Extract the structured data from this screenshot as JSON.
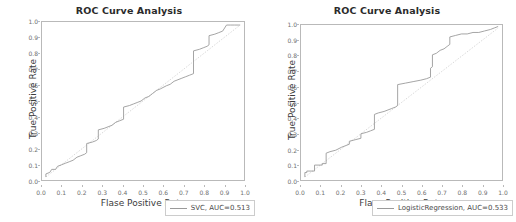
{
  "figure": {
    "width": 516,
    "height": 222,
    "background": "#ffffff",
    "panels": [
      {
        "id": "roc-left",
        "title": "ROC Curve Analysis",
        "xlabel": "Flase Positive Rate",
        "ylabel": "True Positive Rate",
        "legend_label": "SVC, AUC=0.513",
        "legend_line_color": "#9a9a9a"
      },
      {
        "id": "roc-right",
        "title": "ROC Curve Analysis",
        "xlabel": "Flase Positive Rate",
        "ylabel": "True Positive Rate",
        "legend_label": "LogisticRegression, AUC=0.533",
        "legend_line_color": "#9a9a9a"
      }
    ]
  },
  "ticks": {
    "x": [
      "0.0",
      "0.1",
      "0.2",
      "0.3",
      "0.4",
      "0.5",
      "0.6",
      "0.7",
      "0.8",
      "0.9",
      "1.0"
    ],
    "y": [
      "0.0",
      "0.1",
      "0.2",
      "0.3",
      "0.4",
      "0.5",
      "0.6",
      "0.7",
      "0.8",
      "0.9",
      "1.0"
    ]
  },
  "colors": {
    "curve": "#9a9a9a",
    "chance_line": "#cfcfcf",
    "axis": "#b9b9b9",
    "title_text": "#2b2b2b",
    "tick_text": "#6e6e6e",
    "label_text": "#3c3c3c"
  },
  "chart_data": [
    {
      "type": "line",
      "id": "roc-left",
      "title": "ROC Curve Analysis",
      "xlabel": "Flase Positive Rate",
      "ylabel": "True Positive Rate",
      "xlim": [
        -0.02,
        1.02
      ],
      "ylim": [
        -0.02,
        1.02
      ],
      "grid": false,
      "legend_position": "lower right",
      "annotations": [
        "dashed chance diagonal from (0,0) to (1,1)"
      ],
      "series": [
        {
          "name": "SVC, AUC=0.513",
          "auc": 0.513,
          "drawstyle": "steps-post",
          "color": "#9a9a9a",
          "x": [
            0.0,
            0.0,
            0.02,
            0.03,
            0.05,
            0.06,
            0.08,
            0.1,
            0.12,
            0.14,
            0.16,
            0.18,
            0.2,
            0.21,
            0.21,
            0.24,
            0.26,
            0.27,
            0.27,
            0.3,
            0.32,
            0.34,
            0.36,
            0.38,
            0.4,
            0.4,
            0.43,
            0.45,
            0.47,
            0.49,
            0.51,
            0.53,
            0.55,
            0.57,
            0.59,
            0.62,
            0.64,
            0.66,
            0.68,
            0.7,
            0.72,
            0.74,
            0.76,
            0.76,
            0.79,
            0.81,
            0.83,
            0.84,
            0.84,
            0.87,
            0.89,
            0.91,
            0.93,
            0.95,
            0.97,
            0.99,
            1.0
          ],
          "y": [
            0.0,
            0.02,
            0.03,
            0.05,
            0.05,
            0.07,
            0.08,
            0.09,
            0.1,
            0.11,
            0.13,
            0.14,
            0.15,
            0.16,
            0.22,
            0.23,
            0.24,
            0.25,
            0.31,
            0.32,
            0.33,
            0.34,
            0.36,
            0.37,
            0.38,
            0.46,
            0.47,
            0.48,
            0.49,
            0.5,
            0.52,
            0.53,
            0.55,
            0.57,
            0.58,
            0.6,
            0.61,
            0.63,
            0.64,
            0.65,
            0.66,
            0.67,
            0.68,
            0.83,
            0.84,
            0.85,
            0.86,
            0.87,
            0.93,
            0.94,
            0.95,
            0.96,
            1.0,
            1.0,
            1.0,
            1.0,
            1.0
          ]
        },
        {
          "name": "chance",
          "style": "dotted",
          "color": "#cfcfcf",
          "x": [
            0.0,
            1.0
          ],
          "y": [
            0.0,
            1.0
          ]
        }
      ]
    },
    {
      "type": "line",
      "id": "roc-right",
      "title": "ROC Curve Analysis",
      "xlabel": "Flase Positive Rate",
      "ylabel": "True Positive Rate",
      "xlim": [
        -0.02,
        1.02
      ],
      "ylim": [
        -0.02,
        1.02
      ],
      "grid": false,
      "legend_position": "lower right",
      "annotations": [
        "dashed chance diagonal from (0,0) to (1,1)"
      ],
      "series": [
        {
          "name": "LogisticRegression, AUC=0.533",
          "auc": 0.533,
          "drawstyle": "steps-post",
          "color": "#9a9a9a",
          "x": [
            0.0,
            0.0,
            0.01,
            0.01,
            0.05,
            0.05,
            0.09,
            0.09,
            0.11,
            0.11,
            0.13,
            0.16,
            0.19,
            0.21,
            0.23,
            0.23,
            0.26,
            0.29,
            0.29,
            0.32,
            0.34,
            0.36,
            0.36,
            0.38,
            0.41,
            0.43,
            0.45,
            0.47,
            0.48,
            0.48,
            0.52,
            0.56,
            0.6,
            0.63,
            0.65,
            0.65,
            0.66,
            0.66,
            0.68,
            0.7,
            0.72,
            0.74,
            0.75,
            0.75,
            0.78,
            0.81,
            0.84,
            0.87,
            0.9,
            0.93,
            0.96,
            0.98,
            1.0
          ],
          "y": [
            0.0,
            0.03,
            0.03,
            0.04,
            0.04,
            0.08,
            0.08,
            0.09,
            0.09,
            0.16,
            0.17,
            0.18,
            0.2,
            0.21,
            0.22,
            0.24,
            0.25,
            0.26,
            0.29,
            0.3,
            0.31,
            0.32,
            0.42,
            0.43,
            0.44,
            0.45,
            0.46,
            0.47,
            0.48,
            0.62,
            0.63,
            0.64,
            0.65,
            0.66,
            0.67,
            0.73,
            0.74,
            0.82,
            0.83,
            0.85,
            0.86,
            0.88,
            0.89,
            0.94,
            0.95,
            0.96,
            0.96,
            0.97,
            0.97,
            0.98,
            0.99,
            1.0,
            1.01
          ]
        },
        {
          "name": "chance",
          "style": "dotted",
          "color": "#cfcfcf",
          "x": [
            0.0,
            1.0
          ],
          "y": [
            0.0,
            1.0
          ]
        }
      ]
    }
  ]
}
